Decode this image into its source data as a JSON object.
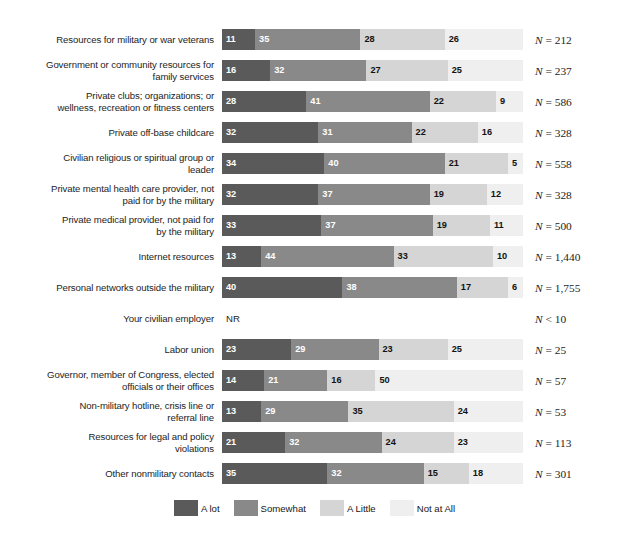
{
  "chart_data": {
    "type": "bar",
    "orientation": "horizontal",
    "stacked": true,
    "stacked_100": true,
    "title": "",
    "subtitle": "",
    "xlabel": "",
    "ylabel": "",
    "xlim": [
      0,
      100
    ],
    "grid": false,
    "legend_position": "bottom",
    "legend": [
      "A lot",
      "Somewhat",
      "A Little",
      "Not at All"
    ],
    "series_colors": [
      "#5a5a5a",
      "#898989",
      "#d5d5d5",
      "#efefef"
    ],
    "series": [
      {
        "name": "A lot",
        "values": [
          11,
          16,
          28,
          32,
          34,
          32,
          33,
          13,
          40,
          null,
          23,
          14,
          13,
          21,
          35
        ]
      },
      {
        "name": "Somewhat",
        "values": [
          35,
          32,
          41,
          31,
          40,
          37,
          37,
          44,
          38,
          null,
          29,
          21,
          29,
          32,
          32
        ]
      },
      {
        "name": "A Little",
        "values": [
          28,
          27,
          22,
          22,
          21,
          19,
          19,
          33,
          17,
          null,
          23,
          16,
          35,
          24,
          15
        ]
      },
      {
        "name": "Not at All",
        "values": [
          26,
          25,
          9,
          16,
          5,
          12,
          11,
          10,
          6,
          null,
          25,
          50,
          24,
          23,
          18
        ]
      }
    ],
    "categories": [
      "Resources for military or war veterans",
      "Government or community resources for family services",
      "Private clubs; organizations; or wellness, recreation or fitness centers",
      "Private off-base childcare",
      "Civilian religious or spiritual group or leader",
      "Private mental health care provider, not paid for by the military",
      "Private medical provider, not paid for by the military",
      "Internet resources",
      "Personal networks outside the military",
      "Your civilian employer",
      "Labor union",
      "Governor, member of Congress, elected officials or their offices",
      "Non-military hotline, crisis line or referral line",
      "Resources for legal and policy violations",
      "Other nonmilitary contacts"
    ],
    "annotations": [
      "NR"
    ],
    "n_labels": [
      "N = 212",
      "N = 237",
      "N = 586",
      "N = 328",
      "N = 558",
      "N = 328",
      "N = 500",
      "N = 1,440",
      "N = 1,755",
      "N < 10",
      "N = 25",
      "N = 57",
      "N = 53",
      "N = 113",
      "N = 301"
    ]
  },
  "rows": [
    {
      "label": "Resources for military or war veterans",
      "label_lines": [
        "Resources for military or war veterans"
      ],
      "values": [
        11,
        35,
        28,
        26
      ],
      "n_prefix": "N",
      "n_rest": " = 212",
      "no_data": false,
      "no_data_text": ""
    },
    {
      "label": "Government or community resources for family services",
      "label_lines": [
        "Government or community resources for",
        "family services"
      ],
      "values": [
        16,
        32,
        27,
        25
      ],
      "n_prefix": "N",
      "n_rest": " = 237",
      "no_data": false,
      "no_data_text": ""
    },
    {
      "label": "Private clubs; organizations; or wellness, recreation or fitness centers",
      "label_lines": [
        "Private clubs; organizations; or",
        "wellness, recreation or fitness centers"
      ],
      "values": [
        28,
        41,
        22,
        9
      ],
      "n_prefix": "N",
      "n_rest": " = 586",
      "no_data": false,
      "no_data_text": ""
    },
    {
      "label": "Private off-base childcare",
      "label_lines": [
        "Private off-base childcare"
      ],
      "values": [
        32,
        31,
        22,
        16
      ],
      "n_prefix": "N",
      "n_rest": " = 328",
      "no_data": false,
      "no_data_text": ""
    },
    {
      "label": "Civilian religious or spiritual group or leader",
      "label_lines": [
        "Civilian religious or spiritual group or",
        "leader"
      ],
      "values": [
        34,
        40,
        21,
        5
      ],
      "n_prefix": "N",
      "n_rest": " = 558",
      "no_data": false,
      "no_data_text": ""
    },
    {
      "label": "Private mental health care provider, not paid for by the military",
      "label_lines": [
        "Private mental health care provider, not",
        "paid for by the military"
      ],
      "values": [
        32,
        37,
        19,
        12
      ],
      "n_prefix": "N",
      "n_rest": " = 328",
      "no_data": false,
      "no_data_text": ""
    },
    {
      "label": "Private medical provider, not paid for by the military",
      "label_lines": [
        "Private medical provider, not paid for",
        "by the military"
      ],
      "values": [
        33,
        37,
        19,
        11
      ],
      "n_prefix": "N",
      "n_rest": " = 500",
      "no_data": false,
      "no_data_text": ""
    },
    {
      "label": "Internet resources",
      "label_lines": [
        "Internet resources"
      ],
      "values": [
        13,
        44,
        33,
        10
      ],
      "n_prefix": "N",
      "n_rest": " = 1,440",
      "no_data": false,
      "no_data_text": ""
    },
    {
      "label": "Personal networks outside the military",
      "label_lines": [
        "Personal networks outside the military"
      ],
      "values": [
        40,
        38,
        17,
        6
      ],
      "n_prefix": "N",
      "n_rest": " = 1,755",
      "no_data": false,
      "no_data_text": ""
    },
    {
      "label": "Your civilian employer",
      "label_lines": [
        "Your civilian employer"
      ],
      "values": [],
      "n_prefix": "N",
      "n_rest": " < 10",
      "no_data": true,
      "no_data_text": "NR"
    },
    {
      "label": "Labor union",
      "label_lines": [
        "Labor union"
      ],
      "values": [
        23,
        29,
        23,
        25
      ],
      "n_prefix": "N",
      "n_rest": " = 25",
      "no_data": false,
      "no_data_text": ""
    },
    {
      "label": "Governor, member of Congress, elected officials or their offices",
      "label_lines": [
        "Governor, member of Congress, elected",
        "officials or their offices"
      ],
      "values": [
        14,
        21,
        16,
        50
      ],
      "n_prefix": "N",
      "n_rest": " = 57",
      "no_data": false,
      "no_data_text": ""
    },
    {
      "label": "Non-military hotline, crisis line or referral line",
      "label_lines": [
        "Non-military hotline, crisis line or",
        "referral line"
      ],
      "values": [
        13,
        29,
        35,
        24
      ],
      "n_prefix": "N",
      "n_rest": " = 53",
      "no_data": false,
      "no_data_text": ""
    },
    {
      "label": "Resources for legal and policy violations",
      "label_lines": [
        "Resources for legal and policy",
        "violations"
      ],
      "values": [
        21,
        32,
        24,
        23
      ],
      "n_prefix": "N",
      "n_rest": " = 113",
      "no_data": false,
      "no_data_text": ""
    },
    {
      "label": "Other nonmilitary contacts",
      "label_lines": [
        "Other nonmilitary contacts"
      ],
      "values": [
        35,
        32,
        15,
        18
      ],
      "n_prefix": "N",
      "n_rest": " = 301",
      "no_data": false,
      "no_data_text": ""
    }
  ],
  "legend": {
    "items": [
      {
        "label": "A lot",
        "color": "#5a5a5a"
      },
      {
        "label": "Somewhat",
        "color": "#898989"
      },
      {
        "label": "A Little",
        "color": "#d5d5d5"
      },
      {
        "label": "Not at All",
        "color": "#efefef"
      }
    ]
  }
}
